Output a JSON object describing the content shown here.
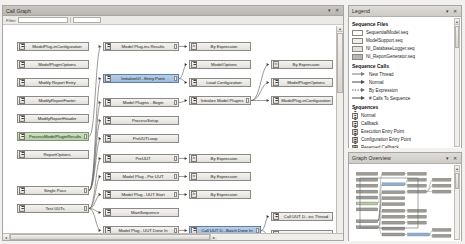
{
  "window": {
    "title": "Call Graph",
    "minimize_glyph": "▾",
    "close_glyph": "✕"
  },
  "toolbar": {
    "filter_label": "Filter",
    "field_value": "",
    "field_placeholder": ""
  },
  "graph": {
    "nodes": [
      {
        "id": "n1",
        "label": "ModelPlug-inConfiguration",
        "x": 14,
        "y": 16,
        "w": 72,
        "style": "normal",
        "icon": "sequence-icon",
        "stub": false
      },
      {
        "id": "n2",
        "label": "ModelPluginOptions",
        "x": 14,
        "y": 34,
        "w": 72,
        "style": "normal",
        "icon": "sequence-icon",
        "stub": false
      },
      {
        "id": "n3",
        "label": "Modify Report Entry",
        "x": 14,
        "y": 52,
        "w": 72,
        "style": "normal",
        "icon": "sequence-icon",
        "stub": false
      },
      {
        "id": "n4",
        "label": "ModifyReportFooter",
        "x": 14,
        "y": 70,
        "w": 72,
        "style": "normal",
        "icon": "sequence-icon",
        "stub": false
      },
      {
        "id": "n5",
        "label": "ModifyReportHeader",
        "x": 14,
        "y": 88,
        "w": 72,
        "style": "normal",
        "icon": "sequence-icon",
        "stub": false
      },
      {
        "id": "n6",
        "label": "ProcessModelPluginResults",
        "x": 14,
        "y": 106,
        "w": 72,
        "style": "green",
        "icon": "sequence-icon",
        "stub": true
      },
      {
        "id": "n7",
        "label": "ReportOptions",
        "x": 14,
        "y": 124,
        "w": 72,
        "style": "normal",
        "icon": "sequence-icon",
        "stub": false
      },
      {
        "id": "n8",
        "label": "Single Pass",
        "x": 14,
        "y": 160,
        "w": 72,
        "style": "normal",
        "icon": "sequence-icon",
        "stub": true
      },
      {
        "id": "n9",
        "label": "Test UUTs",
        "x": 14,
        "y": 178,
        "w": 72,
        "style": "normal",
        "icon": "sequence-icon",
        "stub": true
      },
      {
        "id": "m1",
        "label": "Model Plug-ins Results",
        "x": 100,
        "y": 16,
        "w": 76,
        "style": "normal",
        "icon": "sequence-icon",
        "stub": true
      },
      {
        "id": "m2",
        "label": "InitializeUI - Entry Point",
        "x": 100,
        "y": 48,
        "w": 76,
        "style": "sel",
        "icon": "sequence-icon",
        "stub": true
      },
      {
        "id": "m3",
        "label": "Model Plugins - Begin",
        "x": 100,
        "y": 72,
        "w": 76,
        "style": "normal",
        "icon": "sequence-icon",
        "stub": true
      },
      {
        "id": "m4",
        "label": "ProcessSetup",
        "x": 100,
        "y": 90,
        "w": 76,
        "style": "normal",
        "icon": "sequence-icon",
        "stub": false
      },
      {
        "id": "m5",
        "label": "PreUUTLoop",
        "x": 100,
        "y": 108,
        "w": 76,
        "style": "normal",
        "icon": "sequence-icon",
        "stub": false
      },
      {
        "id": "m6",
        "label": "PreUUT",
        "x": 100,
        "y": 128,
        "w": 76,
        "style": "normal",
        "icon": "sequence-icon",
        "stub": true
      },
      {
        "id": "m7",
        "label": "Model Plug - Pre UUT",
        "x": 100,
        "y": 146,
        "w": 76,
        "style": "normal",
        "icon": "sequence-icon",
        "stub": true
      },
      {
        "id": "m8",
        "label": "Model Plug - UUT Start",
        "x": 100,
        "y": 164,
        "w": 76,
        "style": "normal",
        "icon": "sequence-icon",
        "stub": true
      },
      {
        "id": "m9",
        "label": "MainSequence",
        "x": 100,
        "y": 182,
        "w": 76,
        "style": "normal",
        "icon": "sequence-icon",
        "stub": false
      },
      {
        "id": "m10",
        "label": "Model Plug - UUT Done In",
        "x": 100,
        "y": 200,
        "w": 76,
        "style": "normal",
        "icon": "sequence-icon",
        "stub": true
      },
      {
        "id": "p1",
        "label": "By Expression",
        "x": 186,
        "y": 16,
        "w": 62,
        "style": "expr",
        "icon": "fx-icon",
        "stub": false
      },
      {
        "id": "p2",
        "label": "ModelOptions",
        "x": 186,
        "y": 34,
        "w": 62,
        "style": "normal",
        "icon": "sequence-icon",
        "stub": false
      },
      {
        "id": "p3",
        "label": "Load Configuration",
        "x": 186,
        "y": 52,
        "w": 62,
        "style": "normal",
        "icon": "sequence-icon",
        "stub": false
      },
      {
        "id": "p4",
        "label": "Initialize Model Plugins",
        "x": 186,
        "y": 70,
        "w": 62,
        "style": "normal",
        "icon": "sequence-icon",
        "stub": true
      },
      {
        "id": "p5",
        "label": "By Expression",
        "x": 186,
        "y": 128,
        "w": 62,
        "style": "expr",
        "icon": "fx-icon",
        "stub": false
      },
      {
        "id": "p6",
        "label": "By Expression",
        "x": 186,
        "y": 146,
        "w": 62,
        "style": "expr",
        "icon": "fx-icon",
        "stub": false
      },
      {
        "id": "p7",
        "label": "By Expression",
        "x": 186,
        "y": 164,
        "w": 62,
        "style": "expr",
        "icon": "fx-icon",
        "stub": false
      },
      {
        "id": "p8",
        "label": "Call UUT D...Batch Done In",
        "x": 186,
        "y": 200,
        "w": 72,
        "style": "sel",
        "icon": "sequence-icon",
        "stub": true
      },
      {
        "id": "q1",
        "label": "By Expression",
        "x": 268,
        "y": 34,
        "w": 62,
        "style": "expr",
        "icon": "fx-icon",
        "stub": false
      },
      {
        "id": "q2",
        "label": "ModelPluginOptions",
        "x": 268,
        "y": 52,
        "w": 62,
        "style": "normal",
        "icon": "sequence-icon",
        "stub": false
      },
      {
        "id": "q3",
        "label": "ModelPlug-inConfiguration",
        "x": 268,
        "y": 70,
        "w": 62,
        "style": "normal",
        "icon": "sequence-icon",
        "stub": false
      },
      {
        "id": "q4",
        "label": "Call UUT D...inc Thread",
        "x": 268,
        "y": 186,
        "w": 62,
        "style": "normal",
        "icon": "sequence-icon",
        "stub": false
      },
      {
        "id": "q5",
        "label": "By Expression",
        "x": 268,
        "y": 204,
        "w": 62,
        "style": "expr",
        "icon": "fx-icon",
        "stub": false
      }
    ],
    "edges": [
      {
        "from": "n6",
        "to": "m1"
      },
      {
        "from": "n8",
        "to": "m2"
      },
      {
        "from": "n8",
        "to": "m3"
      },
      {
        "from": "n8",
        "to": "m4"
      },
      {
        "from": "n8",
        "to": "m5"
      },
      {
        "from": "n9",
        "to": "m6"
      },
      {
        "from": "n9",
        "to": "m7"
      },
      {
        "from": "n9",
        "to": "m8"
      },
      {
        "from": "n9",
        "to": "m9"
      },
      {
        "from": "n9",
        "to": "m10"
      },
      {
        "from": "m1",
        "to": "p1"
      },
      {
        "from": "m2",
        "to": "p2"
      },
      {
        "from": "m2",
        "to": "p3"
      },
      {
        "from": "m3",
        "to": "p4"
      },
      {
        "from": "m6",
        "to": "p5"
      },
      {
        "from": "m7",
        "to": "p6"
      },
      {
        "from": "m8",
        "to": "p7"
      },
      {
        "from": "m10",
        "to": "p8"
      },
      {
        "from": "p4",
        "to": "q1"
      },
      {
        "from": "p4",
        "to": "q2"
      },
      {
        "from": "p4",
        "to": "q3"
      },
      {
        "from": "p8",
        "to": "q4"
      },
      {
        "from": "p8",
        "to": "q5"
      }
    ],
    "hscroll": {
      "left_glyph": "◂",
      "right_glyph": "▸"
    },
    "vscroll": {
      "up_glyph": "▴",
      "down_glyph": "▾"
    }
  },
  "legend": {
    "title": "Legend",
    "collapse_glyph": "▾",
    "close_glyph": "✕",
    "sections": [
      {
        "heading": "Sequence Files",
        "kind": "swatch",
        "items": [
          {
            "label": "SequentialModel.seq",
            "color": "#ffffff"
          },
          {
            "label": "ModelSupport.seq",
            "color": "#f0eee9"
          },
          {
            "label": "NI_DatabaseLogger.seq",
            "color": "#e4e1db"
          },
          {
            "label": "NI_ReportGenerator.seq",
            "color": "#b9b6b0"
          }
        ]
      },
      {
        "heading": "Sequence Calls",
        "kind": "arrow",
        "items": [
          {
            "label": "New Thread",
            "color": "#7a7874",
            "dash": "0"
          },
          {
            "label": "Normal",
            "color": "#4a4946",
            "dash": "0"
          },
          {
            "label": "By Expression",
            "color": "#6b6a66",
            "dash": "1.5 1.2"
          },
          {
            "label": "# Calls To Sequence",
            "color": "#4a4946",
            "dash": "0"
          }
        ]
      },
      {
        "heading": "Sequences",
        "kind": "icon",
        "items": [
          {
            "label": "Normal",
            "color": "#eceae5"
          },
          {
            "label": "Callback",
            "color": "#dfddd7"
          },
          {
            "label": "Execution Entry Point",
            "color": "#cfccc6"
          },
          {
            "label": "Configuration Entry Point",
            "color": "#c2bfb9"
          },
          {
            "label": "Reserved Callback",
            "color": "#a9a6a0"
          }
        ]
      }
    ],
    "scroll": {
      "up_glyph": "▴",
      "down_glyph": "▾"
    }
  },
  "overview": {
    "title": "Graph Overview",
    "collapse_glyph": "▾",
    "close_glyph": "✕",
    "scroll": {
      "up_glyph": "▴",
      "down_glyph": "▾"
    }
  }
}
